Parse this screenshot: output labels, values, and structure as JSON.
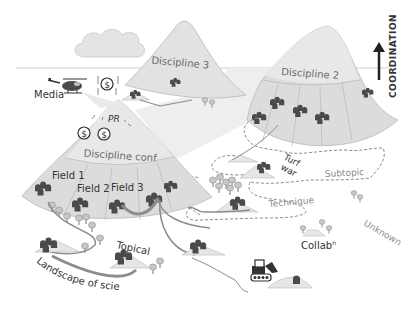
{
  "diagram": {
    "title_axis": "COORDINATION",
    "colors": {
      "mountain_fill": "#dcdcdc",
      "mountain_cap": "#e8e8e8",
      "mountain_stroke": "#b8b8b8",
      "house": "#4a4a4a",
      "tree": "#b8b8b8",
      "path": "#8c8c8c",
      "dashed": "#8c8c8c",
      "shadow": "#eeeeee",
      "text_dark": "#333333",
      "text_grey": "#8a8a8a"
    },
    "labels": {
      "media": "Media",
      "pr": "PR",
      "discipline_conf": "Discipline conf",
      "discipline_2": "Discipline 2",
      "discipline_3": "Discipline 3",
      "field_1": "Field 1",
      "field_2": "Field 2",
      "field_3": "Field 3",
      "turf_war_1": "Turf",
      "turf_war_2": "war",
      "subtopic": "Subtopic",
      "technique": "Technique",
      "unknown": "Unknown",
      "collab": "Collab",
      "collab_sup": "n",
      "topical": "Topical",
      "landscape": "Landscape of science",
      "coordination": "COORDINATION",
      "dollar": "$"
    }
  }
}
